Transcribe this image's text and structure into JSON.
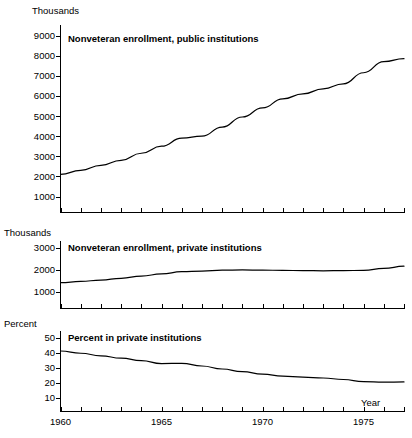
{
  "figure": {
    "axis_color": "#000000",
    "line_color": "#000000",
    "background": "#ffffff",
    "x_axis_title": "Year"
  },
  "chart_data": [
    {
      "type": "line",
      "title": "Nonveteran enrollment, public institutions",
      "xlabel": "",
      "ylabel": "Thousands",
      "ylim": [
        0,
        9500
      ],
      "xlim": [
        1960,
        1977
      ],
      "grid": false,
      "legend": "none",
      "yticks": [
        1000,
        2000,
        3000,
        4000,
        5000,
        6000,
        7000,
        8000,
        9000
      ],
      "ytick_labels": [
        "1000",
        "2000",
        "3000",
        "4000",
        "5000",
        "6000",
        "7000",
        "8000",
        "9000"
      ],
      "xticks": [
        1960,
        1961,
        1962,
        1963,
        1964,
        1965,
        1966,
        1967,
        1968,
        1969,
        1970,
        1971,
        1972,
        1973,
        1974,
        1975,
        1976,
        1977
      ],
      "xtick_labels": [],
      "x": [
        1960,
        1961,
        1962,
        1963,
        1964,
        1965,
        1966,
        1967,
        1968,
        1969,
        1970,
        1971,
        1972,
        1973,
        1974,
        1975,
        1976,
        1977
      ],
      "values": [
        2100,
        2300,
        2550,
        2800,
        3150,
        3500,
        3900,
        4000,
        4450,
        4950,
        5400,
        5850,
        6100,
        6350,
        6600,
        7150,
        7700,
        7850
      ]
    },
    {
      "type": "line",
      "title": "Nonveteran enrollment, private institutions",
      "xlabel": "",
      "ylabel": "Thousands",
      "ylim": [
        0,
        3400
      ],
      "xlim": [
        1960,
        1977
      ],
      "grid": false,
      "legend": "none",
      "yticks": [
        1000,
        2000,
        3000
      ],
      "ytick_labels": [
        "1000",
        "2000",
        "3000"
      ],
      "xticks": [
        1960,
        1961,
        1962,
        1963,
        1964,
        1965,
        1966,
        1967,
        1968,
        1969,
        1970,
        1971,
        1972,
        1973,
        1974,
        1975,
        1976,
        1977
      ],
      "xtick_labels": [],
      "x": [
        1960,
        1961,
        1962,
        1963,
        1964,
        1965,
        1966,
        1967,
        1968,
        1969,
        1970,
        1971,
        1972,
        1973,
        1974,
        1975,
        1976,
        1977
      ],
      "values": [
        1400,
        1460,
        1520,
        1600,
        1700,
        1800,
        1900,
        1930,
        1970,
        1980,
        1970,
        1960,
        1950,
        1940,
        1950,
        1960,
        2050,
        2150
      ]
    },
    {
      "type": "line",
      "title": "Percent in private institutions",
      "xlabel": "Year",
      "ylabel": "Percent",
      "ylim": [
        0,
        57
      ],
      "xlim": [
        1960,
        1977
      ],
      "grid": false,
      "legend": "none",
      "yticks": [
        10,
        20,
        30,
        40,
        50
      ],
      "ytick_labels": [
        "10",
        "20",
        "30",
        "40",
        "50"
      ],
      "xticks": [
        1960,
        1961,
        1962,
        1963,
        1964,
        1965,
        1966,
        1967,
        1968,
        1969,
        1970,
        1971,
        1972,
        1973,
        1974,
        1975,
        1976,
        1977
      ],
      "xtick_labels": [
        "1960",
        "",
        "",
        "",
        "",
        "1965",
        "",
        "",
        "",
        "",
        "1970",
        "",
        "",
        "",
        "",
        "1975",
        "",
        ""
      ],
      "x": [
        1960,
        1961,
        1962,
        1963,
        1964,
        1965,
        1966,
        1967,
        1968,
        1969,
        1970,
        1971,
        1972,
        1973,
        1974,
        1975,
        1976,
        1977
      ],
      "values": [
        41.0,
        39.5,
        37.8,
        36.2,
        34.6,
        32.6,
        32.8,
        31.0,
        29.0,
        27.2,
        25.6,
        24.2,
        23.6,
        23.0,
        22.0,
        20.6,
        20.2,
        20.4
      ]
    }
  ]
}
